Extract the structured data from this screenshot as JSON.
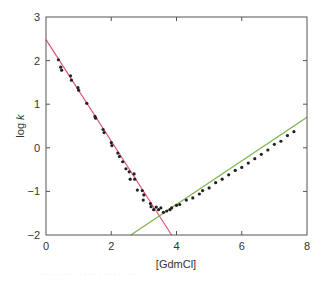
{
  "chart_data": {
    "type": "scatter",
    "title": "",
    "xlabel": "[GdmCl]",
    "ylabel_prefix": "log ",
    "ylabel_var": "k",
    "xlim": [
      0,
      8
    ],
    "ylim": [
      -2,
      3
    ],
    "xticks": [
      0,
      2,
      4,
      6,
      8
    ],
    "yticks": [
      -2,
      -1,
      0,
      1,
      2,
      3
    ],
    "grid": false,
    "legend": null,
    "series": [
      {
        "name": "refolding data",
        "color": "#222222",
        "points": [
          [
            0.38,
            2.02
          ],
          [
            0.45,
            1.85
          ],
          [
            0.48,
            1.78
          ],
          [
            0.75,
            1.65
          ],
          [
            0.78,
            1.55
          ],
          [
            0.98,
            1.38
          ],
          [
            1.0,
            1.32
          ],
          [
            1.25,
            1.02
          ],
          [
            1.5,
            0.72
          ],
          [
            1.52,
            0.68
          ],
          [
            1.75,
            0.42
          ],
          [
            1.78,
            0.35
          ],
          [
            2.0,
            0.12
          ],
          [
            2.02,
            0.05
          ],
          [
            2.2,
            -0.12
          ],
          [
            2.25,
            -0.2
          ],
          [
            2.35,
            -0.32
          ],
          [
            2.45,
            -0.48
          ],
          [
            2.55,
            -0.55
          ],
          [
            2.58,
            -0.72
          ],
          [
            2.7,
            -0.6
          ],
          [
            2.72,
            -0.72
          ],
          [
            2.8,
            -0.97
          ],
          [
            2.95,
            -0.98
          ],
          [
            2.98,
            -1.2
          ],
          [
            3.0,
            -1.08
          ],
          [
            3.2,
            -1.28
          ],
          [
            3.22,
            -1.35
          ],
          [
            3.3,
            -1.42
          ],
          [
            3.38,
            -1.36
          ],
          [
            3.45,
            -1.42
          ],
          [
            3.52,
            -1.38
          ]
        ]
      },
      {
        "name": "unfolding data",
        "color": "#222222",
        "points": [
          [
            3.6,
            -1.48
          ],
          [
            3.7,
            -1.45
          ],
          [
            3.8,
            -1.42
          ],
          [
            3.85,
            -1.38
          ],
          [
            4.0,
            -1.32
          ],
          [
            4.1,
            -1.3
          ],
          [
            4.3,
            -1.2
          ],
          [
            4.5,
            -1.15
          ],
          [
            4.7,
            -1.06
          ],
          [
            4.8,
            -0.98
          ],
          [
            5.0,
            -0.92
          ],
          [
            5.2,
            -0.8
          ],
          [
            5.4,
            -0.72
          ],
          [
            5.6,
            -0.62
          ],
          [
            5.8,
            -0.52
          ],
          [
            6.0,
            -0.45
          ],
          [
            6.2,
            -0.35
          ],
          [
            6.4,
            -0.25
          ],
          [
            6.6,
            -0.15
          ],
          [
            6.8,
            -0.05
          ],
          [
            7.0,
            0.08
          ],
          [
            7.2,
            0.15
          ],
          [
            7.4,
            0.28
          ],
          [
            7.6,
            0.37
          ]
        ]
      }
    ],
    "fit_lines": [
      {
        "name": "refolding fit",
        "color": "#e0557a",
        "x1": 0,
        "y1": 2.48,
        "x2": 3.85,
        "y2": -2
      },
      {
        "name": "unfolding fit",
        "color": "#7ab648",
        "x1": 2.6,
        "y1": -2,
        "x2": 8,
        "y2": 0.7
      }
    ]
  },
  "caption": "· · · · · · · · · · · · · · · · · · · · ·"
}
